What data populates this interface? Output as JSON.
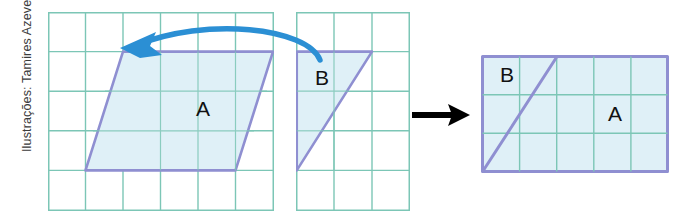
{
  "credit": {
    "text": "Ilustrações: Tamires Azevedo"
  },
  "labels": {
    "parallelogram_a": "A",
    "triangle_b": "B",
    "result_b": "B",
    "result_a": "A"
  },
  "colors": {
    "grid_line": "#7cc6b6",
    "shape_outline": "#8f8fd1",
    "shape_fill": "#dff0f7",
    "curved_arrow": "#2b8fd4",
    "straight_arrow": "#000000",
    "background": "#ffffff",
    "text": "#111111"
  },
  "figures": {
    "left": {
      "name": "parallelogram-grid",
      "grid_cols": 6,
      "grid_rows": 5,
      "shape": "parallelogram",
      "shape_label": "A"
    },
    "middle": {
      "name": "triangle-grid",
      "grid_cols": 3,
      "grid_rows": 5,
      "shape": "right-triangle",
      "shape_label": "B"
    },
    "right": {
      "name": "rectangle-result",
      "grid_cols": 5,
      "grid_rows": 3,
      "shape": "rectangle-with-diagonal",
      "shape_labels": [
        "B",
        "A"
      ]
    }
  },
  "arrows": {
    "curved": "curved-blue-arrow-left",
    "straight": "straight-black-arrow-right"
  }
}
